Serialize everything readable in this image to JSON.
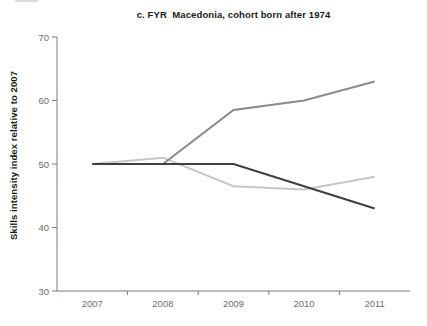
{
  "chart_data": {
    "type": "line",
    "title": "c. FYR  Macedonia, cohort born after 1974",
    "xlabel": "",
    "ylabel": "Skills intensity index relative to 2007",
    "categories": [
      "2007",
      "2008",
      "2009",
      "2010",
      "2011"
    ],
    "series": [
      {
        "name": "light-gray-series",
        "color": "#c6c6c6",
        "values": [
          50,
          51,
          46.5,
          46,
          48
        ]
      },
      {
        "name": "medium-gray-series",
        "color": "#8a8a8a",
        "values": [
          50,
          50,
          58.5,
          60,
          63
        ]
      },
      {
        "name": "dark-gray-series",
        "color": "#3f3f3f",
        "values": [
          50,
          50,
          50,
          46.5,
          43
        ]
      }
    ],
    "ylim": [
      30,
      70
    ],
    "yticks": [
      30,
      40,
      50,
      60,
      70
    ],
    "grid": false,
    "legend": "none"
  },
  "colors": {
    "axis": "#7a7a7a",
    "tick_label": "#6e6e6e",
    "title_text": "#1a1a1a",
    "background": "#ffffff"
  }
}
